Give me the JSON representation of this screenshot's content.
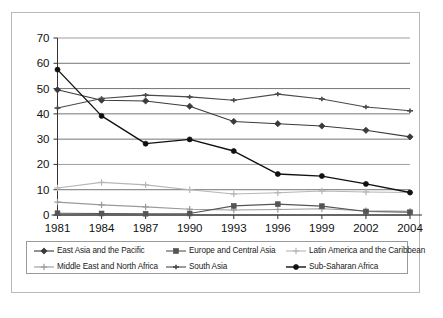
{
  "figure": {
    "background": "#ffffff",
    "frame_color": "#b9b9b9"
  },
  "chart_data": {
    "type": "line",
    "title": "",
    "subtitle": "",
    "xlabel": "",
    "ylabel": "",
    "x": [
      "1981",
      "1984",
      "1987",
      "1990",
      "1993",
      "1996",
      "1999",
      "2002",
      "2004"
    ],
    "categories": [
      "1981",
      "1984",
      "1987",
      "1990",
      "1993",
      "1996",
      "1999",
      "2002",
      "2004"
    ],
    "ylim": [
      0,
      70
    ],
    "yticks": [
      0,
      10,
      20,
      30,
      40,
      50,
      60,
      70
    ],
    "ytick_labels": [
      "0",
      "10",
      "20",
      "30",
      "40",
      "50",
      "60",
      "70"
    ],
    "grid": true,
    "grid_axis": "y",
    "legend_position": "bottom",
    "legend_columns": 3,
    "series": [
      {
        "name": "East Asia and the Pacific",
        "color": "#3a3a3a",
        "marker": "diamond",
        "values": [
          49.5,
          45.4,
          45.1,
          43.0,
          37.0,
          36.1,
          35.2,
          33.5,
          30.9
        ]
      },
      {
        "name": "Europe and Central Asia",
        "color": "#555555",
        "marker": "square",
        "values": [
          0.7,
          0.6,
          0.5,
          0.6,
          3.6,
          4.3,
          3.5,
          1.4,
          1.1
        ]
      },
      {
        "name": "Latin America and the Caribbean",
        "color": "#b6b6b6",
        "marker": "plus",
        "values": [
          10.7,
          12.9,
          11.9,
          10.0,
          8.3,
          8.8,
          9.5,
          9.1,
          8.9
        ]
      },
      {
        "name": "Middle East and North Africa",
        "color": "#9a9a9a",
        "marker": "plus",
        "values": [
          5.1,
          4.0,
          3.2,
          2.3,
          2.0,
          2.2,
          2.5,
          1.7,
          1.5
        ]
      },
      {
        "name": "South Asia",
        "color": "#4a4a4a",
        "marker": "dash",
        "values": [
          42.3,
          46.1,
          47.4,
          46.7,
          45.4,
          47.8,
          45.9,
          42.7,
          41.2
        ]
      },
      {
        "name": "Sub-Saharan Africa",
        "color": "#111111",
        "marker": "circle",
        "values": [
          57.5,
          39.2,
          28.2,
          29.9,
          25.3,
          16.2,
          15.4,
          12.3,
          8.9
        ]
      }
    ]
  },
  "legend": {
    "items": [
      {
        "label": "East Asia and the Pacific"
      },
      {
        "label": "Europe and Central Asia"
      },
      {
        "label": "Latin America and the Caribbean"
      },
      {
        "label": "Middle East and North Africa"
      },
      {
        "label": "South Asia"
      },
      {
        "label": "Sub-Saharan Africa"
      }
    ]
  }
}
